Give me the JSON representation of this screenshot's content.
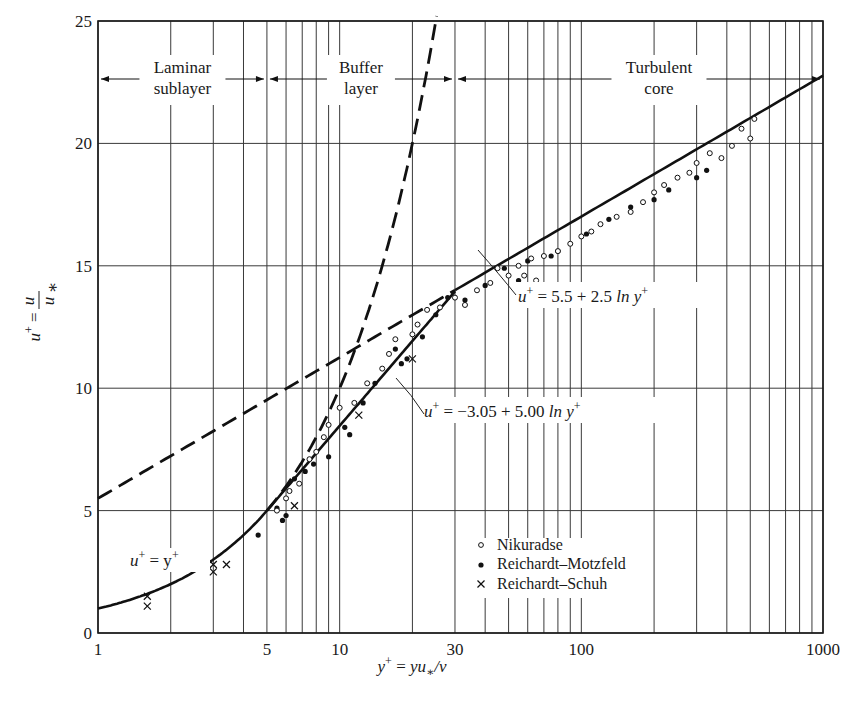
{
  "chart_data": {
    "type": "scatter",
    "title": "",
    "xlabel": "y⁺ = yu∗/ν",
    "ylabel": "u⁺ = u/u∗",
    "xscale": "log",
    "xlim": [
      1,
      1000
    ],
    "ylim": [
      0,
      25
    ],
    "grid": true,
    "x_ticks": [
      1,
      5,
      10,
      30,
      100,
      1000
    ],
    "x_tick_labels": [
      "1",
      "5",
      "10",
      "30",
      "100",
      "1000"
    ],
    "y_ticks": [
      0,
      5,
      10,
      15,
      20,
      25
    ],
    "y_tick_labels": [
      "0",
      "5",
      "10",
      "15",
      "20",
      "25"
    ],
    "regions": [
      {
        "label_line1": "Laminar",
        "label_line2": "sublayer",
        "x_range": [
          1,
          5
        ]
      },
      {
        "label_line1": "Buffer",
        "label_line2": "layer",
        "x_range": [
          5,
          30
        ]
      },
      {
        "label_line1": "Turbulent",
        "label_line2": "core",
        "x_range": [
          30,
          1000
        ]
      }
    ],
    "annotations": [
      {
        "text": "u⁺ = y⁺",
        "applies_to": "laminar sublayer curve"
      },
      {
        "text": "u⁺ = −3.05 + 5.00 ln y⁺",
        "applies_to": "buffer layer line"
      },
      {
        "text": "u⁺ = 5.5 + 2.5 ln y⁺",
        "applies_to": "turbulent core line"
      }
    ],
    "lines": [
      {
        "name": "u+ = y+ (laminar, solid to y+=5)",
        "style": "solid",
        "x": [
          1,
          2,
          3,
          4,
          5
        ],
        "y": [
          1,
          2,
          3,
          4,
          5
        ]
      },
      {
        "name": "u+ = -3.05 + 5.00 ln y+ (solid, 5 to 30)",
        "style": "solid",
        "x": [
          5,
          10,
          20,
          30
        ],
        "y": [
          5.0,
          8.46,
          11.93,
          13.96
        ]
      },
      {
        "name": "u+ = 5.5 + 2.5 ln y+ (solid, 30 to 1000)",
        "style": "solid",
        "x": [
          30,
          100,
          1000
        ],
        "y": [
          14.0,
          17.0,
          22.77
        ]
      },
      {
        "name": "u+ = y+ extension (dashed)",
        "style": "dashed",
        "x": [
          5,
          10,
          20,
          25
        ],
        "y": [
          5,
          10,
          20,
          25
        ]
      },
      {
        "name": "u+ = 5.5 + 2.5 ln y+ extension (dashed)",
        "style": "dashed",
        "x": [
          1,
          5,
          10,
          30
        ],
        "y": [
          5.5,
          9.52,
          11.26,
          14.0
        ]
      }
    ],
    "legend": {
      "position": "lower-center",
      "entries": [
        {
          "marker": "open-circle",
          "label": "Nikuradse"
        },
        {
          "marker": "filled-circle",
          "label": "Reichardt–Motzfeld"
        },
        {
          "marker": "cross",
          "label": "Reichardt–Schuh"
        }
      ]
    },
    "series": [
      {
        "name": "Reichardt–Schuh",
        "marker": "cross",
        "x": [
          1.6,
          1.6,
          3.0,
          3.0,
          3.4,
          6.5,
          12.0,
          20.0
        ],
        "y": [
          1.1,
          1.5,
          2.5,
          2.8,
          2.8,
          5.2,
          8.9,
          11.2
        ]
      },
      {
        "name": "Reichardt–Motzfeld",
        "marker": "filled-circle",
        "x": [
          4.6,
          5.5,
          5.8,
          6.0,
          6.5,
          7.2,
          7.8,
          9.0,
          10.5,
          11.0,
          12.5,
          14.0,
          17.0,
          18.0,
          19.0,
          22.0,
          25.0,
          28.0,
          33.0,
          40.0,
          48.0,
          55.0,
          60.0,
          75.0,
          80.0,
          105.0,
          130.0,
          160.0,
          200.0,
          230.0,
          300.0,
          330.0
        ],
        "y": [
          4.0,
          5.1,
          4.6,
          4.8,
          6.3,
          6.6,
          6.9,
          7.2,
          8.4,
          8.1,
          9.4,
          10.2,
          11.6,
          11.0,
          11.2,
          12.1,
          13.0,
          13.7,
          13.6,
          14.2,
          14.9,
          14.4,
          15.2,
          15.4,
          15.6,
          16.3,
          16.9,
          17.4,
          17.7,
          18.1,
          18.6,
          18.9
        ]
      },
      {
        "name": "Nikuradse",
        "marker": "open-circle",
        "x": [
          5.5,
          6.0,
          6.2,
          6.8,
          7.5,
          8.0,
          8.6,
          9.0,
          10.0,
          11.5,
          13.0,
          15.0,
          16.0,
          17.0,
          20.0,
          21.0,
          23.0,
          26.0,
          30.0,
          33.0,
          37.0,
          42.0,
          45.0,
          50.0,
          55.0,
          58.0,
          62.0,
          65.0,
          70.0,
          80.0,
          90.0,
          100.0,
          110.0,
          120.0,
          140.0,
          160.0,
          180.0,
          200.0,
          220.0,
          250.0,
          280.0,
          300.0,
          340.0,
          380.0,
          420.0,
          460.0,
          500.0,
          520.0
        ],
        "y": [
          5.0,
          5.5,
          5.8,
          6.1,
          7.1,
          7.4,
          8.0,
          8.5,
          9.2,
          9.4,
          10.2,
          10.8,
          11.4,
          12.0,
          12.2,
          12.6,
          13.2,
          13.3,
          13.7,
          13.4,
          14.0,
          14.3,
          14.9,
          14.6,
          15.0,
          14.6,
          15.3,
          14.4,
          15.4,
          15.6,
          15.9,
          16.2,
          16.4,
          16.7,
          17.0,
          17.2,
          17.6,
          18.0,
          18.3,
          18.6,
          18.8,
          19.2,
          19.6,
          19.4,
          19.9,
          20.6,
          20.2,
          21.0
        ]
      }
    ]
  },
  "figure": {
    "axis": {
      "x_label": "y⁺ = yu∗/ν",
      "y_label": "u⁺ = u/u∗"
    },
    "x_tick_labels": [
      "1",
      "5",
      "10",
      "30",
      "100",
      "1000"
    ],
    "y_tick_labels": [
      "0",
      "5",
      "10",
      "15",
      "20",
      "25"
    ],
    "regions": {
      "laminar": {
        "line1": "Laminar",
        "line2": "sublayer"
      },
      "buffer": {
        "line1": "Buffer",
        "line2": "layer"
      },
      "turbulent": {
        "line1": "Turbulent",
        "line2": "core"
      }
    },
    "equations": {
      "laminar": {
        "lhs": "u",
        "sup": "+",
        "rest": " = y",
        "sup2": "+"
      },
      "buffer": {
        "lhs": "u",
        "sup": "+",
        "rest": " = −3.05 + 5.00 ",
        "ln": "ln",
        "var": " y",
        "sup2": "+"
      },
      "turbulent": {
        "lhs": "u",
        "sup": "+",
        "rest": " = 5.5 + 2.5 ",
        "ln": "ln",
        "var": " y",
        "sup2": "+"
      }
    },
    "legend": [
      {
        "glyph": "∘",
        "label": "Nikuradse"
      },
      {
        "glyph": "•",
        "label": "Reichardt–Motzfeld"
      },
      {
        "glyph": "×",
        "label": "Reichardt–Schuh"
      }
    ]
  }
}
